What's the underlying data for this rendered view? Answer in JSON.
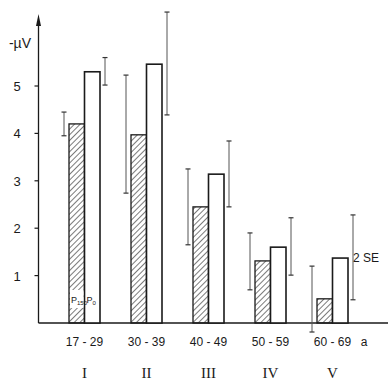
{
  "chart_data": {
    "type": "bar",
    "title": "",
    "ylabel": "-µV",
    "xlabel": "a",
    "ylim": [
      0,
      6.5
    ],
    "yticks": [
      1,
      2,
      3,
      4,
      5
    ],
    "grid": false,
    "categories": [
      "17-29",
      "30-39",
      "40-49",
      "50-59",
      "60-69"
    ],
    "group_labels": [
      "I",
      "II",
      "III",
      "IV",
      "V"
    ],
    "series": [
      {
        "name": "P150",
        "style": "hatched",
        "values": [
          4.2,
          3.97,
          2.45,
          1.31,
          0.51
        ],
        "error_low": [
          3.95,
          2.74,
          1.65,
          0.7,
          -0.19
        ],
        "error_high": [
          4.45,
          5.23,
          3.25,
          1.9,
          1.2
        ]
      },
      {
        "name": "P0",
        "style": "open",
        "values": [
          5.3,
          5.46,
          3.14,
          1.6,
          1.37
        ],
        "error_low": [
          5.02,
          4.39,
          2.45,
          1.01,
          0.49
        ],
        "error_high": [
          5.6,
          6.56,
          3.84,
          2.22,
          2.28
        ]
      }
    ],
    "annotations": [
      "2 SE",
      "P150",
      "P0"
    ]
  },
  "labels": {
    "y_unit": "-µV",
    "x_unit": "a",
    "se_note": "2 SE",
    "p150_main": "P",
    "p150_sub": "150",
    "p0_main": "P",
    "p0_sub": "0"
  }
}
